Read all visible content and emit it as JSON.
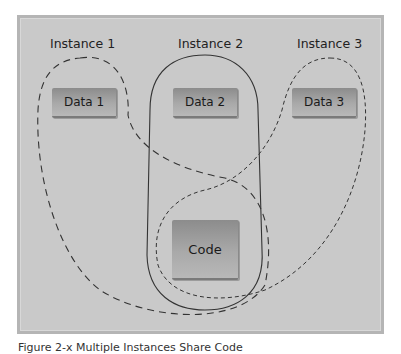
{
  "diagram": {
    "instances": [
      {
        "label": "Instance 1",
        "data_label": "Data 1",
        "outline": "dashed-long"
      },
      {
        "label": "Instance 2",
        "data_label": "Data 2",
        "outline": "solid"
      },
      {
        "label": "Instance 3",
        "data_label": "Data 3",
        "outline": "dashed-short"
      }
    ],
    "shared_box": {
      "label": "Code"
    },
    "caption": "Figure 2-x  Multiple Instances Share Code"
  },
  "colors": {
    "panel": "#c9c9c9",
    "box_top": "#8c8c8c",
    "box_bottom": "#b8b8b8",
    "line": "#333333"
  }
}
